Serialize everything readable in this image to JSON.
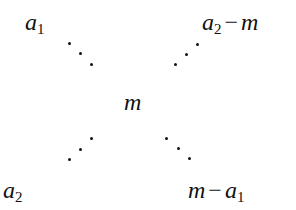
{
  "diagram": {
    "top_left": {
      "var": "a",
      "sub": "1"
    },
    "top_right": {
      "var": "a",
      "sub": "2",
      "op": "−",
      "rhs": "m"
    },
    "center": {
      "var": "m"
    },
    "bottom_left": {
      "var": "a",
      "sub": "2"
    },
    "bottom_right": {
      "lhs": "m",
      "op": "−",
      "var": "a",
      "sub": "1"
    },
    "connectors": [
      "diagonal-dots-top-left",
      "diagonal-dots-top-right",
      "diagonal-dots-bottom-left",
      "diagonal-dots-bottom-right"
    ]
  }
}
